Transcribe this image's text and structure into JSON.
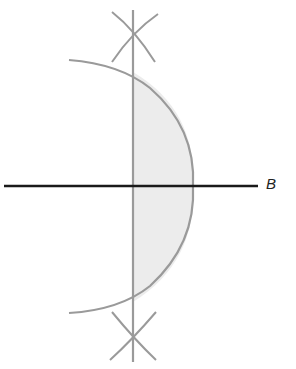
{
  "diagram": {
    "type": "geometric-construction",
    "labels": {
      "line_label": "B"
    },
    "colors": {
      "background": "#ffffff",
      "horizontal_line": "#1a1a1a",
      "construction_lines": "#9a9a9a",
      "shaded_region": "#ececec"
    },
    "elements": {
      "horizontal_line": {
        "x1": 4,
        "y1": 186,
        "x2": 258,
        "y2": 186
      },
      "vertical_line": {
        "x1": 133,
        "y1": 10,
        "x2": 133,
        "y2": 362
      },
      "arc": {
        "start": [
          69,
          60
        ],
        "apex": [
          193,
          186
        ],
        "end": [
          69,
          313
        ]
      },
      "top_cross": {
        "center": [
          133,
          33
        ]
      },
      "bottom_cross": {
        "center": [
          133,
          341
        ]
      }
    }
  }
}
